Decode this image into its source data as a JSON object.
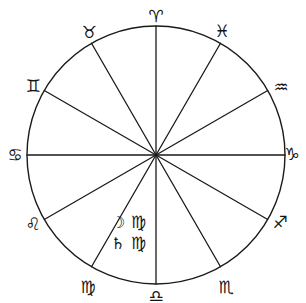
{
  "chart_data": {
    "type": "pie",
    "title": "",
    "subtitle": "",
    "xlabel": "",
    "ylabel": "",
    "legend_position": "outside-ring",
    "grid": false,
    "geometry": {
      "center_x": 156,
      "center_y": 155,
      "radius": 129,
      "sector_count": 12,
      "sector_degrees": 30,
      "stroke_color": "#1a1a1a",
      "fill_color": "#ffffff",
      "stroke_width": 1.4
    },
    "categories": [
      "Aries",
      "Pisces",
      "Aquarius",
      "Capricorn",
      "Sagittarius",
      "Scorpio",
      "Libra",
      "Virgo",
      "Leo",
      "Cancer",
      "Gemini",
      "Taurus"
    ],
    "values": [
      30,
      30,
      30,
      30,
      30,
      30,
      30,
      30,
      30,
      30,
      30,
      30
    ]
  },
  "wheel": {
    "signs": [
      {
        "name": "Aries",
        "glyph": "♈",
        "angle_deg": 90,
        "label_x": 156,
        "label_y": 16
      },
      {
        "name": "Taurus",
        "glyph": "♉",
        "angle_deg": 120,
        "label_x": 89,
        "label_y": 32
      },
      {
        "name": "Gemini",
        "glyph": "♊",
        "angle_deg": 150,
        "label_x": 33,
        "label_y": 86
      },
      {
        "name": "Cancer",
        "glyph": "♋",
        "angle_deg": 180,
        "label_x": 15,
        "label_y": 155
      },
      {
        "name": "Leo",
        "glyph": "♌",
        "angle_deg": 210,
        "label_x": 33,
        "label_y": 224
      },
      {
        "name": "Virgo",
        "glyph": "♍",
        "angle_deg": 240,
        "label_x": 88,
        "label_y": 287
      },
      {
        "name": "Libra",
        "glyph": "♎",
        "angle_deg": 270,
        "label_x": 156,
        "label_y": 296
      },
      {
        "name": "Scorpio",
        "glyph": "♏",
        "angle_deg": 300,
        "label_x": 226,
        "label_y": 287
      },
      {
        "name": "Sagittarius",
        "glyph": "♐",
        "angle_deg": 330,
        "label_x": 280,
        "label_y": 222
      },
      {
        "name": "Capricorn",
        "glyph": "♑",
        "angle_deg": 0,
        "label_x": 292,
        "label_y": 154
      },
      {
        "name": "Aquarius",
        "glyph": "♒",
        "angle_deg": 30,
        "label_x": 281,
        "label_y": 87
      },
      {
        "name": "Pisces",
        "glyph": "♓",
        "angle_deg": 60,
        "label_x": 222,
        "label_y": 31
      }
    ]
  },
  "placements": [
    {
      "planet_name": "Moon",
      "planet_glyph": "☽",
      "sign_name": "Virgo",
      "sign_glyph": "♍"
    },
    {
      "planet_name": "Saturn",
      "planet_glyph": "♄",
      "sign_name": "Virgo",
      "sign_glyph": "♍"
    }
  ]
}
